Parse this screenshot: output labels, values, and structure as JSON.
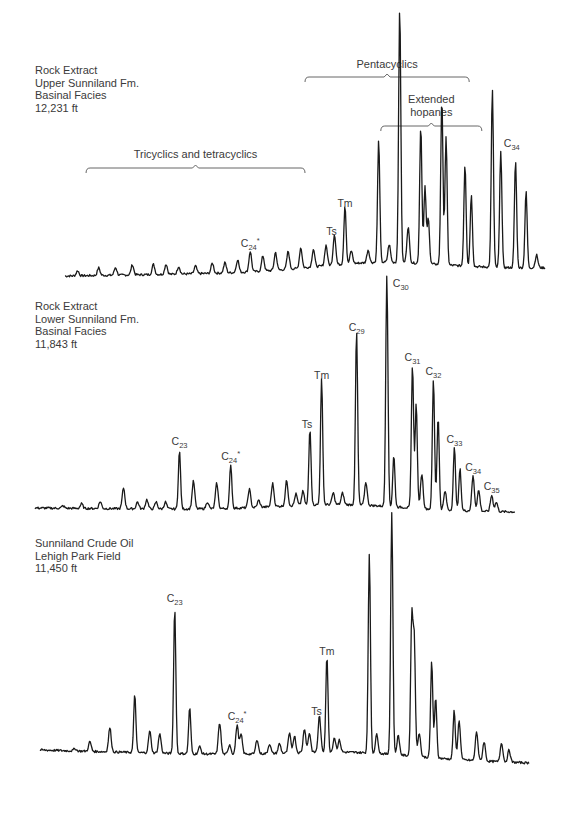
{
  "chart_data": [
    {
      "type": "line",
      "title": "Rock Extract / Upper Sunniland Fm. / Basinal Facies / 12,231 ft",
      "sample_label": [
        "Rock Extract",
        "Upper Sunniland Fm.",
        "Basinal Facies",
        "12,231 ft"
      ],
      "xlabel": "",
      "ylabel": "",
      "x_range": [
        0,
        100
      ],
      "ylim": [
        0,
        100
      ],
      "grid": false,
      "brackets": [
        {
          "label": "Tricyclics and tetracyclics",
          "x_start": 5,
          "x_end": 57
        },
        {
          "label": "Pentacyclics",
          "x_start": 57,
          "x_end": 96
        },
        {
          "label_lines": [
            "Extended",
            "hopanes"
          ],
          "x_start": 75,
          "x_end": 99
        }
      ],
      "peaks": [
        {
          "x": 3,
          "y": 2
        },
        {
          "x": 8,
          "y": 3
        },
        {
          "x": 12,
          "y": 3
        },
        {
          "x": 16,
          "y": 4
        },
        {
          "x": 21,
          "y": 4
        },
        {
          "x": 24,
          "y": 4
        },
        {
          "x": 27,
          "y": 3
        },
        {
          "x": 31,
          "y": 3
        },
        {
          "x": 35,
          "y": 4
        },
        {
          "x": 38,
          "y": 4
        },
        {
          "x": 41,
          "y": 5
        },
        {
          "x": 44,
          "y": 8,
          "label": "C24*"
        },
        {
          "x": 47,
          "y": 6
        },
        {
          "x": 50,
          "y": 7
        },
        {
          "x": 53,
          "y": 7
        },
        {
          "x": 56,
          "y": 8
        },
        {
          "x": 59,
          "y": 7
        },
        {
          "x": 62,
          "y": 8
        },
        {
          "x": 64,
          "y": 12,
          "label": "Ts"
        },
        {
          "x": 66.5,
          "y": 23,
          "label": "Tm"
        },
        {
          "x": 68,
          "y": 5
        },
        {
          "x": 72,
          "y": 5
        },
        {
          "x": 74.5,
          "y": 48
        },
        {
          "x": 77,
          "y": 7
        },
        {
          "x": 79.5,
          "y": 100
        },
        {
          "x": 81.5,
          "y": 14
        },
        {
          "x": 84.5,
          "y": 54
        },
        {
          "x": 85.5,
          "y": 30
        },
        {
          "x": 86.3,
          "y": 18
        },
        {
          "x": 89.5,
          "y": 65
        },
        {
          "x": 90.5,
          "y": 50
        },
        {
          "x": 95,
          "y": 40
        },
        {
          "x": 96.5,
          "y": 28
        },
        {
          "x": 101.5,
          "y": 70
        },
        {
          "x": 103.5,
          "y": 46,
          "label": "C34"
        },
        {
          "x": 107,
          "y": 42
        },
        {
          "x": 109.5,
          "y": 30
        },
        {
          "x": 112,
          "y": 5
        }
      ]
    },
    {
      "type": "line",
      "title": "Rock Extract / Lower Sunniland Fm. / Basinal Facies / 11,843 ft",
      "sample_label": [
        "Rock Extract",
        "Lower Sunniland Fm.",
        "Basinal Facies",
        "11,843 ft"
      ],
      "xlabel": "",
      "ylabel": "",
      "x_range": [
        0,
        100
      ],
      "ylim": [
        0,
        100
      ],
      "grid": false,
      "peaks": [
        {
          "x": 6,
          "y": 1
        },
        {
          "x": 10,
          "y": 2
        },
        {
          "x": 14,
          "y": 3
        },
        {
          "x": 19,
          "y": 9
        },
        {
          "x": 22,
          "y": 3
        },
        {
          "x": 24,
          "y": 4
        },
        {
          "x": 26,
          "y": 3
        },
        {
          "x": 28,
          "y": 3
        },
        {
          "x": 31,
          "y": 25,
          "label": "C23"
        },
        {
          "x": 34,
          "y": 12
        },
        {
          "x": 37,
          "y": 3
        },
        {
          "x": 39,
          "y": 11
        },
        {
          "x": 42,
          "y": 19,
          "label": "C24*"
        },
        {
          "x": 46,
          "y": 8
        },
        {
          "x": 48,
          "y": 3
        },
        {
          "x": 51,
          "y": 10
        },
        {
          "x": 54,
          "y": 11
        },
        {
          "x": 56,
          "y": 5
        },
        {
          "x": 57.5,
          "y": 6
        },
        {
          "x": 59,
          "y": 33,
          "label": "Ts"
        },
        {
          "x": 61.5,
          "y": 54,
          "label": "Tm"
        },
        {
          "x": 64,
          "y": 5
        },
        {
          "x": 66,
          "y": 5
        },
        {
          "x": 69,
          "y": 75,
          "label": "C29"
        },
        {
          "x": 71,
          "y": 10
        },
        {
          "x": 75.5,
          "y": 100,
          "label": "C30"
        },
        {
          "x": 77,
          "y": 22
        },
        {
          "x": 81,
          "y": 62,
          "label": "C31"
        },
        {
          "x": 81.8,
          "y": 45
        },
        {
          "x": 83,
          "y": 15
        },
        {
          "x": 85.5,
          "y": 56,
          "label": "C32"
        },
        {
          "x": 86.5,
          "y": 40
        },
        {
          "x": 88,
          "y": 8
        },
        {
          "x": 90,
          "y": 27,
          "label": "C33"
        },
        {
          "x": 91.2,
          "y": 18
        },
        {
          "x": 94,
          "y": 15,
          "label": "C34"
        },
        {
          "x": 95.2,
          "y": 9
        },
        {
          "x": 98,
          "y": 7,
          "label": "C35"
        },
        {
          "x": 99,
          "y": 4
        }
      ]
    },
    {
      "type": "line",
      "title": "Sunniland Crude Oil / Lehigh Park Field / 11,450 ft",
      "sample_label": [
        "Sunniland Crude Oil",
        "Lehigh Park Field",
        "11,450 ft"
      ],
      "xlabel": "",
      "ylabel": "",
      "x_range": [
        0,
        100
      ],
      "ylim": [
        0,
        100
      ],
      "grid": false,
      "peaks": [
        {
          "x": 7,
          "y": 1
        },
        {
          "x": 10,
          "y": 4
        },
        {
          "x": 14,
          "y": 10
        },
        {
          "x": 19,
          "y": 24
        },
        {
          "x": 22,
          "y": 9
        },
        {
          "x": 24,
          "y": 8
        },
        {
          "x": 27,
          "y": 60,
          "label": "C23"
        },
        {
          "x": 30,
          "y": 19
        },
        {
          "x": 32,
          "y": 3
        },
        {
          "x": 36,
          "y": 13
        },
        {
          "x": 38,
          "y": 4
        },
        {
          "x": 39.5,
          "y": 12,
          "label": "C24*"
        },
        {
          "x": 40.3,
          "y": 8
        },
        {
          "x": 43.5,
          "y": 6
        },
        {
          "x": 46,
          "y": 4
        },
        {
          "x": 48,
          "y": 4
        },
        {
          "x": 50,
          "y": 8
        },
        {
          "x": 51,
          "y": 7
        },
        {
          "x": 53,
          "y": 10
        },
        {
          "x": 54,
          "y": 8
        },
        {
          "x": 56,
          "y": 15,
          "label": "Ts"
        },
        {
          "x": 57.5,
          "y": 40,
          "label": "Tm"
        },
        {
          "x": 59,
          "y": 6
        },
        {
          "x": 60,
          "y": 5
        },
        {
          "x": 66,
          "y": 82
        },
        {
          "x": 67.5,
          "y": 8
        },
        {
          "x": 70.5,
          "y": 100
        },
        {
          "x": 71.8,
          "y": 8
        },
        {
          "x": 74.5,
          "y": 57
        },
        {
          "x": 75,
          "y": 48
        },
        {
          "x": 76,
          "y": 10
        },
        {
          "x": 78.5,
          "y": 40
        },
        {
          "x": 79.3,
          "y": 25
        },
        {
          "x": 83,
          "y": 20
        },
        {
          "x": 84,
          "y": 16
        },
        {
          "x": 87.5,
          "y": 12
        },
        {
          "x": 89,
          "y": 8
        },
        {
          "x": 92.5,
          "y": 8
        },
        {
          "x": 94,
          "y": 5
        }
      ]
    }
  ]
}
